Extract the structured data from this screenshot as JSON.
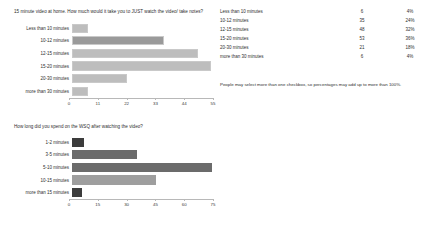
{
  "chart_data": [
    {
      "type": "bar",
      "orientation": "horizontal",
      "title": "15 minute video at home. How much would it take you to JUST watch the video/ take notes?",
      "categories": [
        "Less than 10 minutes",
        "10-12 minutes",
        "12-15 minutes",
        "15-20 minutes",
        "20-30 minutes",
        "more than 30 minutes"
      ],
      "values": [
        6,
        35,
        48,
        53,
        21,
        6
      ],
      "xlabel": "",
      "ylabel": "",
      "xlim": [
        0,
        55
      ],
      "xticks": [
        0,
        11,
        22,
        33,
        44,
        55
      ],
      "grid": false,
      "legend": "none"
    },
    {
      "type": "bar",
      "orientation": "horizontal",
      "title": "How long did you spend on the WSQ after watching the video?",
      "categories": [
        "1-2 minutes",
        "3-5 minutes",
        "5-10 minutes",
        "10-15 minutes",
        "more than 15 minutes"
      ],
      "values": [
        6,
        34,
        73,
        44,
        5
      ],
      "xlabel": "",
      "ylabel": "",
      "xlim": [
        0,
        75
      ],
      "xticks": [
        0,
        15,
        30,
        45,
        60,
        75
      ],
      "grid": false,
      "legend": "none"
    }
  ],
  "section1": {
    "question": "15 minute video at home. How much would it take you to JUST watch the video/ take notes?",
    "chart": {
      "ticks": [
        "0",
        "11",
        "22",
        "33",
        "44",
        "55"
      ],
      "bars": [
        {
          "label": "Less than 10 minutes",
          "value": 6
        },
        {
          "label": "10-12 minutes",
          "value": 35
        },
        {
          "label": "12-15 minutes",
          "value": 48
        },
        {
          "label": "15-20 minutes",
          "value": 53
        },
        {
          "label": "20-30 minutes",
          "value": 21
        },
        {
          "label": "more than 30 minutes",
          "value": 6
        }
      ]
    },
    "table": {
      "rows": [
        {
          "label": "Less than 10 minutes",
          "count": "6",
          "pct": "4%"
        },
        {
          "label": "10-12 minutes",
          "count": "35",
          "pct": "24%"
        },
        {
          "label": "12-15 minutes",
          "count": "48",
          "pct": "32%"
        },
        {
          "label": "15-20 minutes",
          "count": "53",
          "pct": "36%"
        },
        {
          "label": "20-30 minutes",
          "count": "21",
          "pct": "18%"
        },
        {
          "label": "more than 30 minutes",
          "count": "6",
          "pct": "4%"
        }
      ],
      "footnote": "People may select more than one checkbox, so percentages may add up to more than 100%."
    }
  },
  "section2": {
    "question": "How long did you spend on the WSQ after watching the video?",
    "chart": {
      "ticks": [
        "0",
        "15",
        "30",
        "45",
        "60",
        "75"
      ],
      "bars": [
        {
          "label": "1-2 minutes",
          "value": 6
        },
        {
          "label": "3-5 minutes",
          "value": 34
        },
        {
          "label": "5-10 minutes",
          "value": 73
        },
        {
          "label": "10-15 minutes",
          "value": 44
        },
        {
          "label": "more than 15 minutes",
          "value": 5
        }
      ]
    },
    "table": {
      "rows": [
        {
          "label": "1-2 minutes",
          "count": "6",
          "pct": "4%"
        },
        {
          "label": "3-5 minutes",
          "count": "34",
          "pct": "23%"
        },
        {
          "label": "5-10 minutes",
          "count": "73",
          "pct": "49%"
        },
        {
          "label": "10-15 minutes",
          "count": "44",
          "pct": "30%"
        },
        {
          "label": "more than 15 minutes",
          "count": "5",
          "pct": "3%"
        }
      ],
      "footnote": "People may select more than one checkbox, so percentages may add up to more than 100%."
    }
  }
}
